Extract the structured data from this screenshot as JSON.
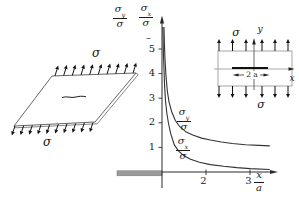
{
  "figure": {
    "left_plate": {
      "sigma_top": "σ",
      "sigma_bottom": "σ"
    },
    "graph": {
      "label_sigma_y": {
        "num": "σ",
        "num_sub": "y",
        "den": "σ"
      },
      "label_sigma_x": {
        "num": "σ",
        "num_sub": "x",
        "den": "σ"
      },
      "dash": "–",
      "curve_label_sigma_y": {
        "num": "σ",
        "num_sub": "y",
        "den": "σ"
      },
      "curve_label_sigma_x": {
        "num": "σ",
        "num_sub": "x",
        "den": "σ"
      },
      "x_axis_label": {
        "num": "x",
        "den": "a"
      },
      "y_tick_labels": [
        "5",
        "4",
        "3",
        "2",
        "1"
      ],
      "x_tick_labels": [
        "2",
        "3"
      ]
    },
    "inset": {
      "sigma_top": "σ",
      "sigma_bottom": "σ",
      "axis_x": "x",
      "axis_y": "y",
      "crack_length_label": "2 a"
    }
  },
  "chart_data": {
    "type": "line",
    "title": "",
    "xlabel": "x/a",
    "ylabel": "σy/σ , σx/σ",
    "xlim": [
      1,
      3.6
    ],
    "ylim": [
      0,
      6.2
    ],
    "x_ticks": [
      2,
      3
    ],
    "y_ticks": [
      1,
      2,
      3,
      4,
      5
    ],
    "grid": false,
    "legend_position": "on-curve",
    "series": [
      {
        "name": "σy/σ",
        "points": [
          [
            1.045,
            5.9
          ],
          [
            1.055,
            5.2
          ],
          [
            1.07,
            4.5
          ],
          [
            1.09,
            3.9
          ],
          [
            1.12,
            3.3
          ],
          [
            1.16,
            2.85
          ],
          [
            1.22,
            2.45
          ],
          [
            1.3,
            2.1
          ],
          [
            1.4,
            1.85
          ],
          [
            1.55,
            1.62
          ],
          [
            1.7,
            1.5
          ],
          [
            1.9,
            1.38
          ],
          [
            2.1,
            1.3
          ],
          [
            2.35,
            1.22
          ],
          [
            2.6,
            1.16
          ],
          [
            2.9,
            1.11
          ],
          [
            3.2,
            1.08
          ],
          [
            3.45,
            1.06
          ]
        ]
      },
      {
        "name": "σx/σ",
        "points": [
          [
            1.02,
            5.9
          ],
          [
            1.03,
            5.0
          ],
          [
            1.045,
            4.2
          ],
          [
            1.06,
            3.5
          ],
          [
            1.08,
            2.9
          ],
          [
            1.11,
            2.4
          ],
          [
            1.15,
            1.95
          ],
          [
            1.2,
            1.55
          ],
          [
            1.28,
            1.1
          ],
          [
            1.38,
            0.85
          ],
          [
            1.5,
            0.66
          ],
          [
            1.65,
            0.52
          ],
          [
            1.85,
            0.4
          ],
          [
            2.1,
            0.3
          ],
          [
            2.4,
            0.23
          ],
          [
            2.7,
            0.18
          ],
          [
            3.0,
            0.14
          ],
          [
            3.45,
            0.1
          ]
        ]
      }
    ],
    "annotations": [
      "crack face shown as gray bar left of origin",
      "origin of x/a axis at crack tip (x/a = 1)"
    ]
  }
}
